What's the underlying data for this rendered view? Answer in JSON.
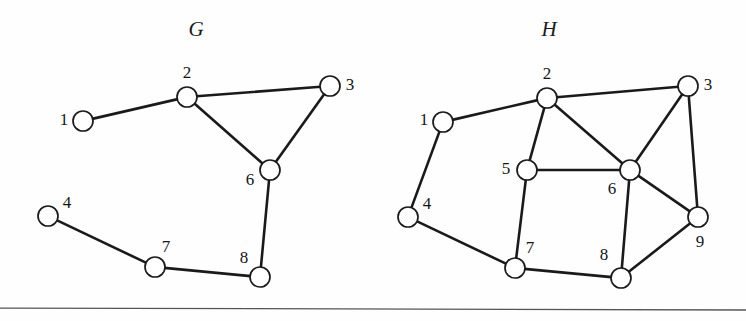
{
  "figure": {
    "width": 746,
    "height": 321,
    "background_color": "#fefefe",
    "ink_color": "#1a1a1a",
    "node_fill_color": "#ffffff",
    "rule_color": "#555555",
    "node_radius": 10
  },
  "separator_rule": {
    "x1": 0,
    "y1": 308,
    "x2": 746,
    "y2": 310
  },
  "graphs": [
    {
      "id": "graph-g",
      "title": "G",
      "title_x": 196,
      "title_y": 36,
      "nodes": [
        {
          "id": "1",
          "label": "1",
          "cx": 83,
          "cy": 121,
          "label_x": 64,
          "label_y": 121
        },
        {
          "id": "2",
          "label": "2",
          "cx": 187,
          "cy": 97,
          "label_x": 187,
          "label_y": 74
        },
        {
          "id": "3",
          "label": "3",
          "cx": 330,
          "cy": 86,
          "label_x": 350,
          "label_y": 86
        },
        {
          "id": "4",
          "label": "4",
          "cx": 48,
          "cy": 216,
          "label_x": 67,
          "label_y": 204
        },
        {
          "id": "6",
          "label": "6",
          "cx": 270,
          "cy": 170,
          "label_x": 250,
          "label_y": 181
        },
        {
          "id": "7",
          "label": "7",
          "cx": 155,
          "cy": 267,
          "label_x": 166,
          "label_y": 248
        },
        {
          "id": "8",
          "label": "8",
          "cx": 260,
          "cy": 277,
          "label_x": 244,
          "label_y": 259
        }
      ],
      "edges": [
        {
          "from": "1",
          "to": "2"
        },
        {
          "from": "2",
          "to": "3"
        },
        {
          "from": "2",
          "to": "6"
        },
        {
          "from": "3",
          "to": "6"
        },
        {
          "from": "6",
          "to": "8"
        },
        {
          "from": "4",
          "to": "7"
        },
        {
          "from": "7",
          "to": "8"
        }
      ]
    },
    {
      "id": "graph-h",
      "title": "H",
      "title_x": 549,
      "title_y": 36,
      "nodes": [
        {
          "id": "1",
          "label": "1",
          "cx": 443,
          "cy": 122,
          "label_x": 424,
          "label_y": 121
        },
        {
          "id": "2",
          "label": "2",
          "cx": 547,
          "cy": 98,
          "label_x": 547,
          "label_y": 75
        },
        {
          "id": "3",
          "label": "3",
          "cx": 688,
          "cy": 86,
          "label_x": 708,
          "label_y": 86
        },
        {
          "id": "4",
          "label": "4",
          "cx": 408,
          "cy": 217,
          "label_x": 427,
          "label_y": 205
        },
        {
          "id": "5",
          "label": "5",
          "cx": 527,
          "cy": 170,
          "label_x": 506,
          "label_y": 170
        },
        {
          "id": "6",
          "label": "6",
          "cx": 630,
          "cy": 170,
          "label_x": 612,
          "label_y": 190
        },
        {
          "id": "7",
          "label": "7",
          "cx": 515,
          "cy": 268,
          "label_x": 530,
          "label_y": 249
        },
        {
          "id": "8",
          "label": "8",
          "cx": 621,
          "cy": 278,
          "label_x": 604,
          "label_y": 256
        },
        {
          "id": "9",
          "label": "9",
          "cx": 698,
          "cy": 217,
          "label_x": 700,
          "label_y": 243
        }
      ],
      "edges": [
        {
          "from": "1",
          "to": "2"
        },
        {
          "from": "1",
          "to": "4"
        },
        {
          "from": "2",
          "to": "3"
        },
        {
          "from": "2",
          "to": "5"
        },
        {
          "from": "2",
          "to": "6"
        },
        {
          "from": "3",
          "to": "6"
        },
        {
          "from": "3",
          "to": "9"
        },
        {
          "from": "5",
          "to": "6"
        },
        {
          "from": "5",
          "to": "7"
        },
        {
          "from": "4",
          "to": "7"
        },
        {
          "from": "6",
          "to": "8"
        },
        {
          "from": "6",
          "to": "9"
        },
        {
          "from": "7",
          "to": "8"
        },
        {
          "from": "8",
          "to": "9"
        }
      ]
    }
  ]
}
